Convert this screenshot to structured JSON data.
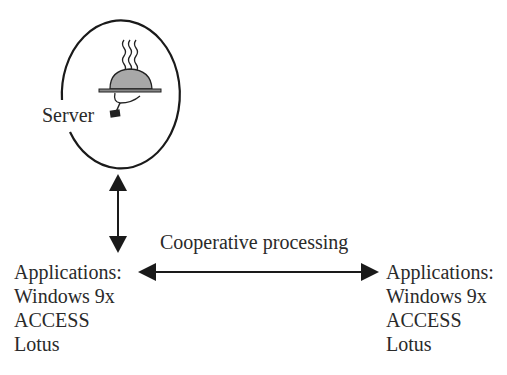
{
  "diagram": {
    "server": {
      "label": "Server",
      "icon": "serving-tray-cloche-icon"
    },
    "link_label": "Cooperative processing",
    "left_client": {
      "lines": [
        "Applications:",
        "Windows 9x",
        "ACCESS",
        "Lotus"
      ]
    },
    "right_client": {
      "lines": [
        "Applications:",
        "Windows 9x",
        "ACCESS",
        "Lotus"
      ]
    },
    "colors": {
      "stroke": "#1a1a1a",
      "cloche_fill": "#a8a8a8",
      "background": "#ffffff"
    }
  }
}
